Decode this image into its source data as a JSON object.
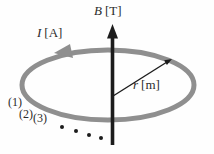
{
  "figure": {
    "type": "physics-diagram",
    "background": "#fefefe",
    "loop_color": "#8f8f8f",
    "axis_color": "#1c1c1c",
    "text_color": "#2b2b2b",
    "labels": {
      "field": {
        "symbol": "B",
        "unit": "[T]"
      },
      "current": {
        "symbol": "I",
        "unit": "[A]"
      },
      "radius": {
        "symbol": "r",
        "unit": "[m]"
      },
      "turns": [
        "(1)",
        "(2)",
        "(3)"
      ]
    }
  }
}
